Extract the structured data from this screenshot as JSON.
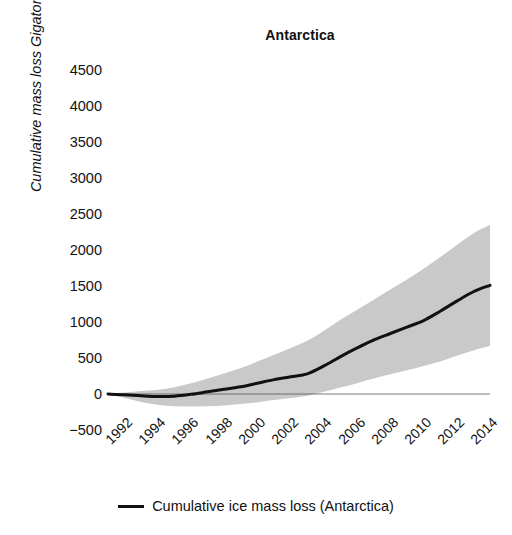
{
  "chart_data": {
    "type": "line",
    "title": "Antarctica",
    "xlabel": "",
    "ylabel": "Cumulative mass loss Gigatonnes (Gt)",
    "xlim": [
      1992,
      2015
    ],
    "ylim": [
      -500,
      4500
    ],
    "grid": false,
    "legend_position": "bottom",
    "xticks": [
      1992,
      1994,
      1996,
      1998,
      2000,
      2002,
      2004,
      2006,
      2008,
      2010,
      2012,
      2014
    ],
    "xtick_labels": [
      "1992",
      "1994",
      "1996",
      "1998",
      "2000",
      "2002",
      "2004",
      "2006",
      "2008",
      "2010",
      "2012",
      "2014"
    ],
    "yticks": [
      -500,
      0,
      500,
      1000,
      1500,
      2000,
      2500,
      3000,
      3500,
      4000,
      4500
    ],
    "ytick_labels": [
      "−500",
      "0",
      "500",
      "1000",
      "1500",
      "2000",
      "2500",
      "3000",
      "3500",
      "4000",
      "4500"
    ],
    "zero_line": 0,
    "x": [
      1992,
      1993,
      1994,
      1995,
      1996,
      1997,
      1998,
      1999,
      2000,
      2001,
      2002,
      2003,
      2004,
      2005,
      2006,
      2007,
      2008,
      2009,
      2010,
      2011,
      2012,
      2013,
      2014,
      2015
    ],
    "series": [
      {
        "name": "Cumulative ice mass loss (Antarctica)",
        "color": "#111111",
        "linewidth": 3,
        "values": [
          0,
          -10,
          -25,
          -35,
          -30,
          -5,
          30,
          65,
          100,
          150,
          200,
          240,
          280,
          390,
          520,
          640,
          750,
          840,
          930,
          1020,
          1150,
          1290,
          1420,
          1510
        ]
      }
    ],
    "uncertainty_band": {
      "label": "uncertainty range",
      "color": "#c9c9c9",
      "opacity": 1,
      "upper": [
        5,
        20,
        40,
        60,
        95,
        150,
        215,
        285,
        360,
        450,
        545,
        640,
        740,
        880,
        1030,
        1170,
        1310,
        1450,
        1590,
        1740,
        1900,
        2070,
        2230,
        2350
      ],
      "lower": [
        -5,
        -55,
        -110,
        -150,
        -170,
        -175,
        -170,
        -160,
        -140,
        -115,
        -85,
        -55,
        -25,
        30,
        90,
        150,
        215,
        275,
        330,
        390,
        450,
        530,
        605,
        665
      ]
    }
  },
  "legend": {
    "entries": [
      {
        "label": "Cumulative ice mass loss (Antarctica)",
        "marker": "line-swatch"
      }
    ]
  }
}
